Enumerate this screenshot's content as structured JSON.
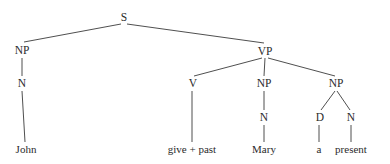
{
  "figure": {
    "kind": "syntax-tree",
    "sentence": "John give + past Mary a present",
    "background_color": "#ffffff",
    "line_color": "#3b3b3b",
    "text_color": "#2b2b2b",
    "width": 390,
    "height": 164
  },
  "nodes": [
    {
      "id": "s",
      "label": "S",
      "x": 124,
      "y": 21,
      "type": "category"
    },
    {
      "id": "np-subj",
      "label": "NP",
      "x": 22,
      "y": 54,
      "type": "category"
    },
    {
      "id": "vp",
      "label": "VP",
      "x": 265,
      "y": 55,
      "type": "category"
    },
    {
      "id": "n-subj",
      "label": "N",
      "x": 22,
      "y": 87,
      "type": "category"
    },
    {
      "id": "v",
      "label": "V",
      "x": 193,
      "y": 87,
      "type": "category"
    },
    {
      "id": "np-iobj",
      "label": "NP",
      "x": 264,
      "y": 87,
      "type": "category"
    },
    {
      "id": "np-dobj",
      "label": "NP",
      "x": 336,
      "y": 87,
      "type": "category"
    },
    {
      "id": "n-iobj",
      "label": "N",
      "x": 264,
      "y": 121,
      "type": "category"
    },
    {
      "id": "d-dobj",
      "label": "D",
      "x": 320,
      "y": 121,
      "type": "category"
    },
    {
      "id": "n-dobj",
      "label": "N",
      "x": 351,
      "y": 121,
      "type": "category"
    }
  ],
  "leaves": [
    {
      "id": "leaf-john",
      "label": "John",
      "x": 26,
      "y": 153,
      "parent": "n-subj"
    },
    {
      "id": "leaf-give",
      "label": "give + past",
      "x": 192,
      "y": 153,
      "parent": "v"
    },
    {
      "id": "leaf-mary",
      "label": "Mary",
      "x": 264,
      "y": 153,
      "parent": "n-iobj"
    },
    {
      "id": "leaf-a",
      "label": "a",
      "x": 319,
      "y": 153,
      "parent": "d-dobj"
    },
    {
      "id": "leaf-present",
      "label": "present",
      "x": 351,
      "y": 153,
      "parent": "n-dobj"
    }
  ],
  "edges": [
    {
      "id": "edge-s-np",
      "from": "s",
      "to": "np-subj",
      "x1": 121,
      "y1": 24,
      "x2": 24,
      "y2": 42
    },
    {
      "id": "edge-s-vp",
      "from": "s",
      "to": "vp",
      "x1": 127,
      "y1": 24,
      "x2": 264,
      "y2": 43
    },
    {
      "id": "edge-np-n-subj",
      "from": "np-subj",
      "to": "n-subj",
      "x1": 22,
      "y1": 58,
      "x2": 22,
      "y2": 76
    },
    {
      "id": "edge-vp-v",
      "from": "vp",
      "to": "v",
      "x1": 262,
      "y1": 58,
      "x2": 194,
      "y2": 76
    },
    {
      "id": "edge-vp-np-iobj",
      "from": "vp",
      "to": "np-iobj",
      "x1": 265,
      "y1": 58,
      "x2": 264,
      "y2": 76
    },
    {
      "id": "edge-vp-np-dobj",
      "from": "vp",
      "to": "np-dobj",
      "x1": 268,
      "y1": 58,
      "x2": 335,
      "y2": 76
    },
    {
      "id": "edge-npiobj-n",
      "from": "np-iobj",
      "to": "n-iobj",
      "x1": 264,
      "y1": 91,
      "x2": 264,
      "y2": 110
    },
    {
      "id": "edge-npdobj-d",
      "from": "np-dobj",
      "to": "d-dobj",
      "x1": 335,
      "y1": 91,
      "x2": 321,
      "y2": 110
    },
    {
      "id": "edge-npdobj-n",
      "from": "np-dobj",
      "to": "n-dobj",
      "x1": 337,
      "y1": 91,
      "x2": 350,
      "y2": 110
    },
    {
      "id": "edge-nsubj-john",
      "from": "n-subj",
      "to": "leaf-john",
      "x1": 22,
      "y1": 91,
      "x2": 25,
      "y2": 142
    },
    {
      "id": "edge-v-give",
      "from": "v",
      "to": "leaf-give",
      "x1": 192,
      "y1": 91,
      "x2": 192,
      "y2": 142
    },
    {
      "id": "edge-niobj-mary",
      "from": "n-iobj",
      "to": "leaf-mary",
      "x1": 264,
      "y1": 125,
      "x2": 264,
      "y2": 142
    },
    {
      "id": "edge-ddobj-a",
      "from": "d-dobj",
      "to": "leaf-a",
      "x1": 319,
      "y1": 125,
      "x2": 319,
      "y2": 142
    },
    {
      "id": "edge-ndobj-present",
      "from": "n-dobj",
      "to": "leaf-present",
      "x1": 351,
      "y1": 125,
      "x2": 351,
      "y2": 142
    }
  ]
}
